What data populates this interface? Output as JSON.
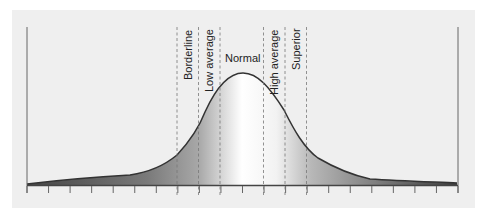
{
  "diagram": {
    "type": "normal-distribution-categories",
    "categories": [
      {
        "name": "borderline",
        "label": "Borderline",
        "orientation": "vertical"
      },
      {
        "name": "low-average",
        "label": "Low average",
        "orientation": "vertical"
      },
      {
        "name": "normal",
        "label": "Normal",
        "orientation": "horizontal"
      },
      {
        "name": "high-average",
        "label": "High average",
        "orientation": "vertical"
      },
      {
        "name": "superior",
        "label": "Superior",
        "orientation": "vertical"
      }
    ],
    "divider_count": 6,
    "tick_count": 21,
    "colors": {
      "background": "#efefef",
      "curve": "#333333",
      "fill_dark": "#555555",
      "fill_light": "#ffffff",
      "divider": "#777777",
      "axis": "#666666"
    }
  }
}
